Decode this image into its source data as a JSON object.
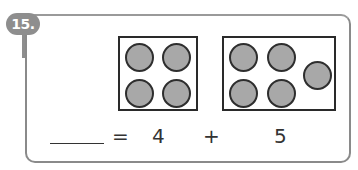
{
  "problem": {
    "number_label": "15.",
    "accent_color": "#8e8e8e"
  },
  "frames": [
    {
      "name": "left-group",
      "count": 4
    },
    {
      "name": "right-group",
      "count": 5
    }
  ],
  "equation": {
    "blank": "",
    "equals": "=",
    "addend_1": "4",
    "plus": "+",
    "addend_2": "5"
  }
}
